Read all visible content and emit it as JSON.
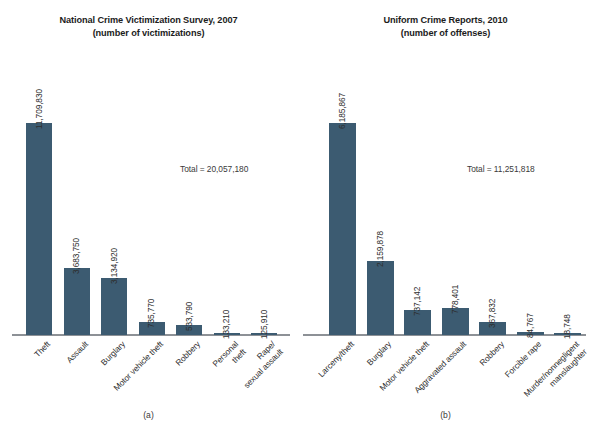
{
  "figure": {
    "background_color": "#ffffff",
    "bar_color": "#3c5b71",
    "axis_color": "#8d9196"
  },
  "chart_data": [
    {
      "type": "bar",
      "panel": "(a)",
      "title": "National Crime Victimization Survey, 2007",
      "subtitle": "(number of victimizations)",
      "annotation": "Total = 20,057,180",
      "xlabel": "",
      "ylabel": "",
      "ylim": [
        0,
        11709830
      ],
      "grid": false,
      "legend": "none",
      "categories": [
        "Theft",
        "Assault",
        "Burglary",
        "Motor vehicle theft",
        "Robbery",
        "Personal theft",
        "Rape/sexual assault"
      ],
      "category_lines": [
        [
          "Theft"
        ],
        [
          "Assault"
        ],
        [
          "Burglary"
        ],
        [
          "Motor vehicle theft"
        ],
        [
          "Robbery"
        ],
        [
          "Personal",
          "theft"
        ],
        [
          "Rape/",
          "sexual assault"
        ]
      ],
      "values": [
        11709830,
        3683750,
        3134920,
        735770,
        533790,
        133210,
        125910
      ],
      "value_labels": [
        "11,709,830",
        "3,683,750",
        "3,134,920",
        "735,770",
        "533,790",
        "133,210",
        "125,910"
      ]
    },
    {
      "type": "bar",
      "panel": "(b)",
      "title": "Uniform Crime Reports, 2010",
      "subtitle": "(number of offenses)",
      "annotation": "Total = 11,251,818",
      "xlabel": "",
      "ylabel": "",
      "ylim": [
        0,
        6185867
      ],
      "grid": false,
      "legend": "none",
      "categories": [
        "Larceny/theft",
        "Burglary",
        "Motor vehicle theft",
        "Aggravated assault",
        "Robbery",
        "Forcible rape",
        "Murder/nonnegligent manslaughter"
      ],
      "category_lines": [
        [
          "Larceny/theft"
        ],
        [
          "Burglary"
        ],
        [
          "Motor vehicle theft"
        ],
        [
          "Aggravated assault"
        ],
        [
          "Robbery"
        ],
        [
          "Forcible rape"
        ],
        [
          "Murder/nonnegligent",
          "manslaughter"
        ]
      ],
      "values": [
        6185867,
        2159878,
        737142,
        778401,
        367832,
        84767,
        18748
      ],
      "value_labels": [
        "6,185,867",
        "2,159,878",
        "737,142",
        "778,401",
        "367,832",
        "84,767",
        "18,748"
      ]
    }
  ]
}
